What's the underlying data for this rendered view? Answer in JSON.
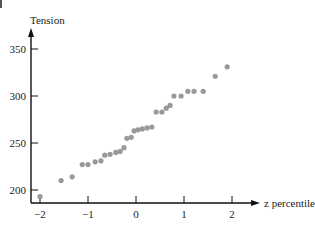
{
  "chart_data": {
    "type": "scatter",
    "title": "",
    "xlabel": "z percentile",
    "ylabel": "Tension",
    "xlim": [
      -2.1,
      2.6
    ],
    "ylim": [
      186,
      375
    ],
    "x_ticks": [
      -2,
      -1,
      0,
      1,
      2
    ],
    "x_tick_labels": [
      "−2",
      "−1",
      "0",
      "1",
      "2"
    ],
    "y_ticks": [
      200,
      250,
      300,
      350
    ],
    "y_tick_labels": [
      "200",
      "250",
      "300",
      "350"
    ],
    "grid": false,
    "legend": null,
    "point_color": "#999999",
    "series": [
      {
        "name": "Tension",
        "points": [
          [
            -2.0,
            193
          ],
          [
            -1.56,
            210
          ],
          [
            -1.33,
            214
          ],
          [
            -1.12,
            227
          ],
          [
            -1.0,
            227
          ],
          [
            -0.85,
            230
          ],
          [
            -0.73,
            231
          ],
          [
            -0.65,
            237
          ],
          [
            -0.54,
            238
          ],
          [
            -0.42,
            240
          ],
          [
            -0.33,
            241
          ],
          [
            -0.25,
            245
          ],
          [
            -0.19,
            255
          ],
          [
            -0.1,
            256
          ],
          [
            -0.04,
            263
          ],
          [
            0.04,
            264
          ],
          [
            0.13,
            265
          ],
          [
            0.23,
            266
          ],
          [
            0.33,
            267
          ],
          [
            0.42,
            283
          ],
          [
            0.54,
            283
          ],
          [
            0.63,
            287
          ],
          [
            0.71,
            290
          ],
          [
            0.79,
            300
          ],
          [
            0.94,
            300
          ],
          [
            1.08,
            305
          ],
          [
            1.21,
            305
          ],
          [
            1.4,
            305
          ],
          [
            1.65,
            321
          ],
          [
            1.9,
            331
          ]
        ]
      }
    ]
  }
}
